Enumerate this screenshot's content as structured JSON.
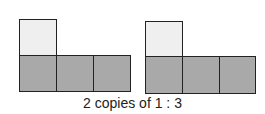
{
  "diagram": {
    "caption": "2 copies of 1 : 3",
    "groups": [
      {
        "name": "copy-1",
        "top_squares": 1,
        "bottom_squares": 3
      },
      {
        "name": "copy-2",
        "top_squares": 1,
        "bottom_squares": 3
      }
    ],
    "colors": {
      "light": "#efefef",
      "dark": "#a9a9a9",
      "stroke": "#222222"
    }
  }
}
